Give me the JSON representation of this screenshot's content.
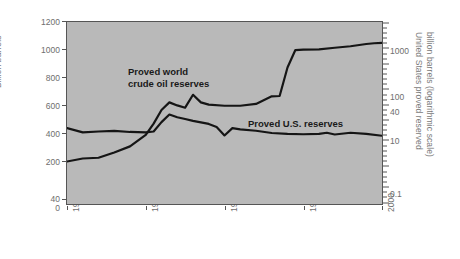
{
  "chart_data": {
    "type": "line",
    "title": "",
    "xlabel": "",
    "ylabel": "Billion barrels",
    "y2label_line1": "United States proved reserved",
    "y2label_line2": "billion barrels (logarithmic scale)",
    "xlim": [
      1960,
      2000
    ],
    "ylim": [
      0,
      1200
    ],
    "y2lim_log": [
      0.1,
      3000
    ],
    "grid": false,
    "legend": "inline-annotations",
    "x_ticks": [
      "1960",
      "1970",
      "1980",
      "1990",
      "2000"
    ],
    "x_tick_values": [
      1960,
      1970,
      1980,
      1990,
      2000
    ],
    "y_left_ticks": [
      "0",
      "40",
      "200",
      "400",
      "600",
      "800",
      "1000",
      "1200"
    ],
    "y_left_tick_values": [
      0,
      40,
      200,
      400,
      600,
      800,
      1000,
      1200
    ],
    "y_right_ticks": [
      "0.1",
      "10",
      "40",
      "100",
      "1000"
    ],
    "y_right_tick_values": [
      0.1,
      10,
      40,
      100,
      1000
    ],
    "annotations": [
      {
        "name": "world-series-label",
        "text_line1": "Proved world",
        "text_line2": "crude oil reserves"
      },
      {
        "name": "us-series-label",
        "text_line1": "Proved U.S. reserves",
        "text_line2": ""
      }
    ],
    "series": [
      {
        "name": "Proved world crude oil reserves",
        "axis": "left",
        "units": "billion barrels",
        "color": "#151515",
        "x": [
          1960,
          1962,
          1964,
          1966,
          1968,
          1970,
          1971,
          1972,
          1973,
          1974,
          1975,
          1976,
          1977,
          1978,
          1980,
          1982,
          1984,
          1986,
          1987,
          1988,
          1989,
          1990,
          1992,
          1994,
          1996,
          1998,
          1999,
          2000
        ],
        "values": [
          280,
          300,
          305,
          340,
          380,
          455,
          530,
          620,
          670,
          650,
          635,
          720,
          670,
          655,
          648,
          648,
          660,
          710,
          712,
          900,
          1015,
          1018,
          1020,
          1030,
          1040,
          1055,
          1060,
          1062
        ]
      },
      {
        "name": "Proved U.S. reserves",
        "axis": "left",
        "units": "billion barrels",
        "color": "#151515",
        "x": [
          1960,
          1962,
          1964,
          1966,
          1968,
          1970,
          1971,
          1972,
          1973,
          1974,
          1975,
          1976,
          1978,
          1979,
          1980,
          1981,
          1982,
          1984,
          1986,
          1988,
          1990,
          1992,
          1993,
          1994,
          1996,
          1998,
          2000
        ],
        "values": [
          500,
          472,
          478,
          482,
          475,
          472,
          478,
          540,
          590,
          572,
          560,
          548,
          528,
          508,
          452,
          500,
          492,
          483,
          468,
          462,
          460,
          462,
          470,
          458,
          470,
          462,
          450
        ]
      }
    ]
  }
}
